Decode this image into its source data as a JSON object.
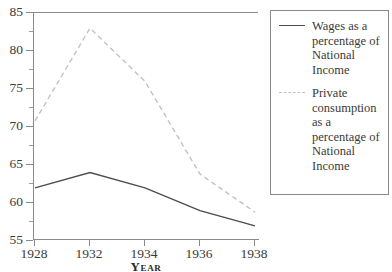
{
  "chart_data": {
    "type": "line",
    "title": "",
    "xlabel": "Year",
    "ylabel": "",
    "categories": [
      "1928",
      "1932",
      "1934",
      "1936",
      "1938"
    ],
    "ylim": [
      55,
      85
    ],
    "y_ticks": [
      55,
      60,
      65,
      70,
      75,
      80,
      85
    ],
    "y_minor_ticks": [
      57.5,
      62.5,
      67.5,
      72.5,
      77.5,
      82.5
    ],
    "grid": false,
    "legend_position": "right",
    "series": [
      {
        "name": "Wages as a percentage of National Income",
        "style": "solid",
        "color": "#4d4d4d",
        "values": [
          62.0,
          64.0,
          62.0,
          59.0,
          57.0
        ]
      },
      {
        "name": "Private consumption as a percentage of National Income",
        "style": "dashed",
        "color": "#c2c2c2",
        "values": [
          70.8,
          83.0,
          76.0,
          63.8,
          58.8
        ]
      }
    ]
  },
  "axes": {
    "x_title": "Year",
    "x_tick_labels": [
      "1928",
      "1932",
      "1934",
      "1936",
      "1938"
    ],
    "y_tick_labels": [
      "85",
      "80",
      "75",
      "70",
      "65",
      "60",
      "55"
    ]
  },
  "legend": {
    "entries": [
      {
        "label": "Wages as a percentage of National Income",
        "style": "solid"
      },
      {
        "label": "Private consumption as a percentage of National Income",
        "style": "dashed"
      }
    ]
  },
  "colors": {
    "wages_line": "#4d4d4d",
    "consumption_line": "#c2c2c2",
    "axis": "#8a8a8a",
    "text": "#3a3a3a",
    "background": "#ffffff"
  }
}
